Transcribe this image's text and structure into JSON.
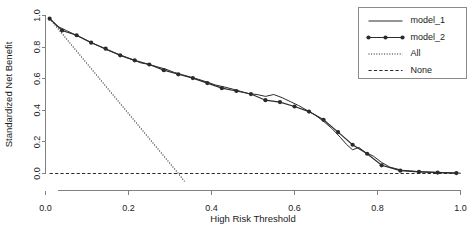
{
  "chart_data": {
    "type": "line",
    "title": "",
    "xlabel": "High Risk Threshold",
    "ylabel": "Standardized Net Benefit",
    "xlim": [
      0.0,
      1.0
    ],
    "ylim": [
      0.0,
      1.0
    ],
    "grid": false,
    "legend_position": "top-right",
    "xticks": [
      "0.0",
      "0.2",
      "0.4",
      "0.6",
      "0.8",
      "1.0"
    ],
    "xtick_values": [
      0.0,
      0.2,
      0.4,
      0.6,
      0.8,
      1.0
    ],
    "yticks": [
      "0.0",
      "0.2",
      "0.4",
      "0.6",
      "0.8",
      "1.0"
    ],
    "ytick_values": [
      0.0,
      0.2,
      0.4,
      0.6,
      0.8,
      1.0
    ],
    "series": [
      {
        "name": "model_1",
        "style": "solid",
        "marker": "none",
        "color": "#2b2b2b",
        "x": [
          0.01,
          0.03,
          0.05,
          0.07,
          0.09,
          0.11,
          0.13,
          0.15,
          0.17,
          0.19,
          0.21,
          0.23,
          0.25,
          0.27,
          0.29,
          0.31,
          0.33,
          0.35,
          0.37,
          0.39,
          0.41,
          0.43,
          0.45,
          0.47,
          0.49,
          0.51,
          0.53,
          0.55,
          0.57,
          0.59,
          0.61,
          0.63,
          0.65,
          0.67,
          0.69,
          0.71,
          0.725,
          0.74,
          0.755,
          0.77,
          0.79,
          0.81,
          0.83,
          0.86,
          0.9,
          0.94,
          0.98,
          1.0
        ],
        "y": [
          0.98,
          0.93,
          0.905,
          0.88,
          0.855,
          0.83,
          0.805,
          0.78,
          0.76,
          0.74,
          0.72,
          0.7,
          0.69,
          0.675,
          0.66,
          0.64,
          0.625,
          0.61,
          0.595,
          0.578,
          0.56,
          0.548,
          0.535,
          0.52,
          0.505,
          0.5,
          0.488,
          0.5,
          0.48,
          0.455,
          0.43,
          0.4,
          0.37,
          0.33,
          0.285,
          0.23,
          0.185,
          0.15,
          0.165,
          0.135,
          0.11,
          0.07,
          0.04,
          0.02,
          0.012,
          0.008,
          0.004,
          0.002
        ]
      },
      {
        "name": "model_2",
        "style": "solid",
        "marker": "filled-circle",
        "color": "#2b2b2b",
        "x": [
          0.01,
          0.04,
          0.075,
          0.11,
          0.145,
          0.18,
          0.215,
          0.25,
          0.285,
          0.32,
          0.355,
          0.39,
          0.425,
          0.46,
          0.495,
          0.53,
          0.565,
          0.6,
          0.635,
          0.67,
          0.705,
          0.74,
          0.775,
          0.81,
          0.855,
          0.9,
          0.945,
          0.99
        ],
        "y": [
          0.98,
          0.905,
          0.875,
          0.828,
          0.79,
          0.748,
          0.716,
          0.69,
          0.654,
          0.628,
          0.604,
          0.572,
          0.54,
          0.522,
          0.503,
          0.464,
          0.452,
          0.424,
          0.392,
          0.34,
          0.262,
          0.182,
          0.125,
          0.052,
          0.018,
          0.01,
          0.006,
          0.003
        ]
      },
      {
        "name": "All",
        "style": "dotted",
        "marker": "none",
        "color": "#1a1a1a",
        "x": [
          0.01,
          0.32,
          0.335
        ],
        "y": [
          0.98,
          0.0,
          -0.05
        ]
      },
      {
        "name": "None",
        "style": "dashed",
        "marker": "none",
        "color": "#2b2b2b",
        "x": [
          0.01,
          1.0
        ],
        "y": [
          0.0,
          0.0
        ]
      }
    ],
    "legend": [
      {
        "label": "model_1",
        "style": "solid",
        "marker": "none"
      },
      {
        "label": "model_2",
        "style": "solid",
        "marker": "filled-circle"
      },
      {
        "label": "All",
        "style": "dotted",
        "marker": "none"
      },
      {
        "label": "None",
        "style": "dashed",
        "marker": "none"
      }
    ]
  }
}
